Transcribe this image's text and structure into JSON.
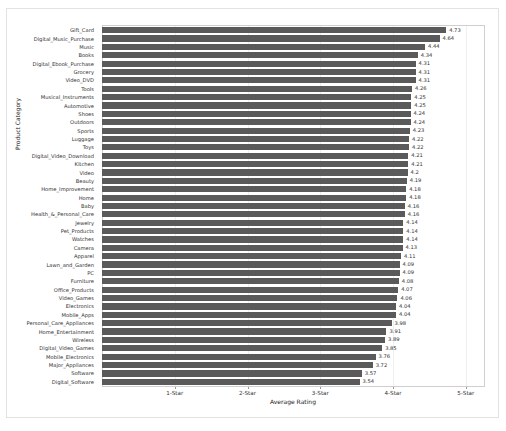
{
  "chart_data": {
    "type": "bar",
    "orientation": "horizontal",
    "title": "",
    "xlabel": "Average Rating",
    "ylabel": "Product Category",
    "xlim": [
      0,
      5.25
    ],
    "grid": true,
    "legend": null,
    "xtick_labels": [
      "1-Star",
      "2-Star",
      "3-Star",
      "4-Star",
      "5-Star"
    ],
    "xtick_values": [
      1,
      2,
      3,
      4,
      5
    ],
    "bar_color": "#5a5a5a",
    "categories": [
      "Gift_Card",
      "Digital_Music_Purchase",
      "Music",
      "Books",
      "Digital_Ebook_Purchase",
      "Grocery",
      "Video_DVD",
      "Tools",
      "Musical_Instruments",
      "Automotive",
      "Shoes",
      "Outdoors",
      "Sports",
      "Luggage",
      "Toys",
      "Digital_Video_Download",
      "Kitchen",
      "Video",
      "Beauty",
      "Home_Improvement",
      "Home",
      "Baby",
      "Health_&_Personal_Care",
      "Jewelry",
      "Pet_Products",
      "Watches",
      "Camera",
      "Apparel",
      "Lawn_and_Garden",
      "PC",
      "Furniture",
      "Office_Products",
      "Video_Games",
      "Electronics",
      "Mobile_Apps",
      "Personal_Care_Appliances",
      "Home_Entertainment",
      "Wireless",
      "Digital_Video_Games",
      "Mobile_Electronics",
      "Major_Appliances",
      "Software",
      "Digital_Software"
    ],
    "values": [
      4.73,
      4.64,
      4.44,
      4.34,
      4.31,
      4.31,
      4.31,
      4.26,
      4.25,
      4.25,
      4.24,
      4.24,
      4.23,
      4.22,
      4.22,
      4.21,
      4.21,
      4.2,
      4.19,
      4.18,
      4.18,
      4.16,
      4.16,
      4.14,
      4.14,
      4.14,
      4.13,
      4.11,
      4.09,
      4.09,
      4.08,
      4.07,
      4.06,
      4.04,
      4.04,
      3.98,
      3.91,
      3.89,
      3.85,
      3.76,
      3.72,
      3.57,
      3.54
    ],
    "value_labels": [
      "4.73",
      "4.64",
      "4.44",
      "4.34",
      "4.31",
      "4.31",
      "4.31",
      "4.26",
      "4.25",
      "4.25",
      "4.24",
      "4.24",
      "4.23",
      "4.22",
      "4.22",
      "4.21",
      "4.21",
      "4.2",
      "4.19",
      "4.18",
      "4.18",
      "4.16",
      "4.16",
      "4.14",
      "4.14",
      "4.14",
      "4.13",
      "4.11",
      "4.09",
      "4.09",
      "4.08",
      "4.07",
      "4.06",
      "4.04",
      "4.04",
      "3.98",
      "3.91",
      "3.89",
      "3.85",
      "3.76",
      "3.72",
      "3.57",
      "3.54"
    ]
  }
}
